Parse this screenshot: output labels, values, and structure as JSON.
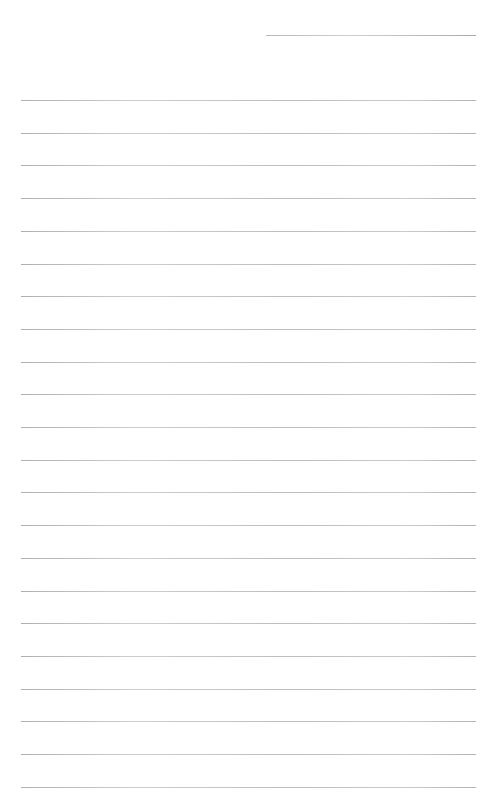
{
  "page": {
    "type": "lined-paper",
    "background": "#ffffff",
    "line_color": "#bdbdbd"
  },
  "header_line": {
    "x": 266,
    "y": 35,
    "width": 210
  },
  "rules": {
    "x": 21,
    "width": 455,
    "first_y": 100,
    "spacing": 32.7,
    "count": 22
  }
}
